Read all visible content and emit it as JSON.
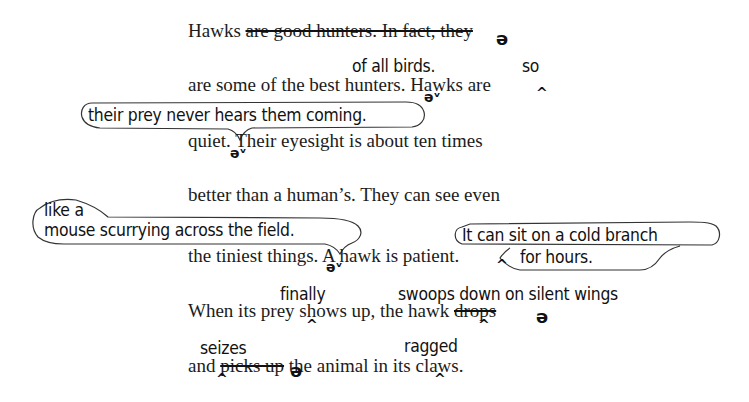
{
  "document": {
    "lines": [
      {
        "id": "l1",
        "prefix": "Hawks ",
        "struck": "are good hunters. In fact, they",
        "suffix": ""
      },
      {
        "id": "l2",
        "text": "are some of the best hunters. Hawks are"
      },
      {
        "id": "l3",
        "text": "quiet. Their eyesight is about ten times"
      },
      {
        "id": "l4",
        "text": "better than a human’s. They can see even"
      },
      {
        "id": "l5",
        "text": "the tiniest things. A hawk is patient."
      },
      {
        "id": "l6",
        "prefix": "When its prey shows up, the hawk ",
        "struck": "drops",
        "suffix": ""
      },
      {
        "id": "l7",
        "prefix": "and ",
        "struck": "picks up",
        "suffix": " the animal in its claws."
      }
    ],
    "handwritten_insertions": {
      "of_all_birds": "of all birds.",
      "so": "so",
      "their_prey": "their prey never hears them coming.",
      "like_a": "like a",
      "mouse": "mouse scurrying across the field.",
      "cold_branch_1": "It can sit on a cold branch",
      "cold_branch_2": "for hours.",
      "finally": "finally",
      "swoops": "swoops down on silent wings",
      "seizes": "seizes",
      "ragged": "ragged"
    },
    "proofreading_marks": {
      "caret": "^",
      "delete": "ə",
      "lowercase_join": "əᵛ"
    }
  }
}
